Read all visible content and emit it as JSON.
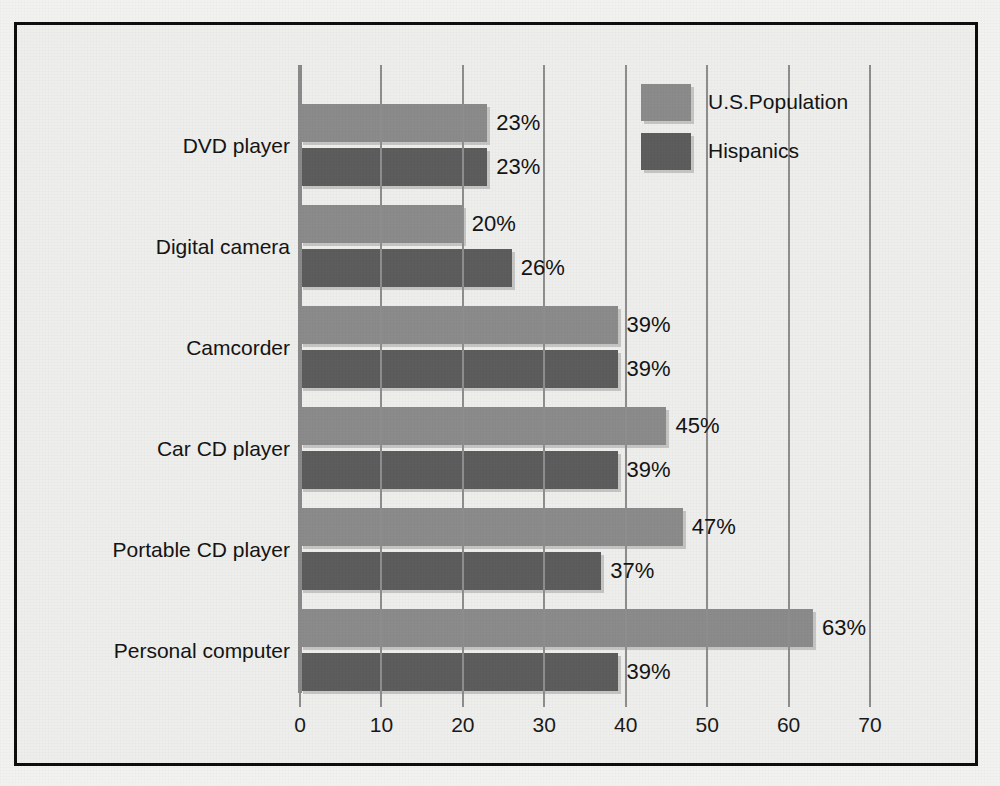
{
  "chart_data": {
    "type": "bar",
    "orientation": "horizontal",
    "title": "",
    "subtitle": "",
    "xlabel": "",
    "ylabel": "",
    "xlim": [
      0,
      70
    ],
    "xticks": [
      0,
      10,
      20,
      30,
      40,
      50,
      60,
      70
    ],
    "xtick_labels": [
      "0",
      "10",
      "20",
      "30",
      "40",
      "50",
      "60",
      "70"
    ],
    "grid": true,
    "grid_axis": "x",
    "legend_position": "top-right",
    "value_label_suffix": "%",
    "categories": [
      "DVD player",
      "Digital camera",
      "Camcorder",
      "Car CD player",
      "Portable CD player",
      "Personal computer"
    ],
    "series": [
      {
        "name": "U.S.Population",
        "color": "#8b8b8b",
        "values": [
          23,
          20,
          39,
          45,
          47,
          63
        ],
        "value_labels": [
          "23%",
          "20%",
          "39%",
          "45%",
          "47%",
          "63%"
        ]
      },
      {
        "name": "Hispanics",
        "color": "#5d5d5d",
        "values": [
          23,
          26,
          39,
          39,
          37,
          39
        ],
        "value_labels": [
          "23%",
          "26%",
          "39%",
          "39%",
          "37%",
          "39%"
        ]
      }
    ]
  },
  "legend": {
    "entries": [
      {
        "label": "U.S.Population",
        "color": "#8b8b8b"
      },
      {
        "label": "Hispanics",
        "color": "#5d5d5d"
      }
    ]
  },
  "colors": {
    "frame_border": "#0d0d0d",
    "plot_background": "#eeeeec",
    "page_background": "#f2f2f0",
    "gridline": "#8e8e8e",
    "text": "#141414",
    "series_us_population": "#8b8b8b",
    "series_hispanics": "#5d5d5d"
  }
}
